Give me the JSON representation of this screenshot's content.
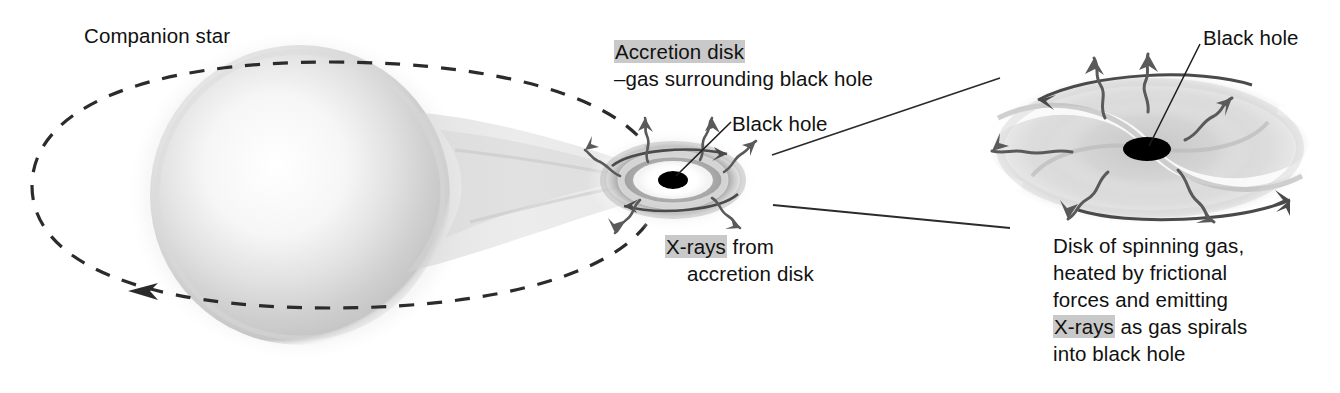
{
  "figure": {
    "background_color": "#ffffff",
    "highlight_color": "#c9c9c9",
    "ink_color": "#111111",
    "width": 1340,
    "height": 393
  },
  "labels": {
    "companion_star": "Companion star",
    "accretion_disk_term": "Accretion disk",
    "accretion_disk_gloss": "–gas surrounding black hole",
    "black_hole_center": "Black hole",
    "black_hole_right": "Black hole",
    "xrays_term": "X-rays",
    "xrays_rest": " from",
    "xrays_line2": "accretion disk",
    "disk_desc_line1": "Disk of spinning gas,",
    "disk_desc_line2": "heated by frictional",
    "disk_desc_line3": "forces and emitting",
    "disk_desc_xrays_term": "X-rays",
    "disk_desc_line4_rest": " as gas spirals",
    "disk_desc_line5": "into black hole"
  },
  "elements": {
    "companion_star": "large soft-shaded luminous sphere on the left",
    "gas_stream": "tapering stream of gas flowing from star to accretion disk",
    "orbit": "dashed elliptical orbit path with direction arrow pointing left",
    "accretion_disk_center": "small gray elliptical accretion disk with black hole at center",
    "accretion_disk_magnified": "large magnified spiral accretion disk with black hole at center",
    "rotation_arrows": "curved arrows showing disk rotation direction",
    "xray_arrows": "wavy arrows radiating outward representing emitted X-rays",
    "magnifier_connectors": "two straight lines linking central disk to magnified view",
    "pointer_lines": "thin leader lines from labels to black holes"
  },
  "icons": {
    "orbit_direction": "arrowhead-icon",
    "xray_wave": "wavy-arrow-icon",
    "rotation": "curved-arrow-icon"
  }
}
